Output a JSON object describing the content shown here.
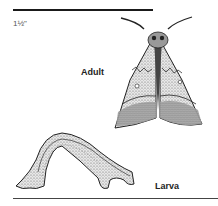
{
  "scale": {
    "text": "1½\""
  },
  "labels": {
    "adult": "Adult",
    "larva": "Larva"
  },
  "illustrations": [
    {
      "name": "adult-moth",
      "caption": "Adult"
    },
    {
      "name": "larva-caterpillar",
      "caption": "Larva"
    }
  ]
}
